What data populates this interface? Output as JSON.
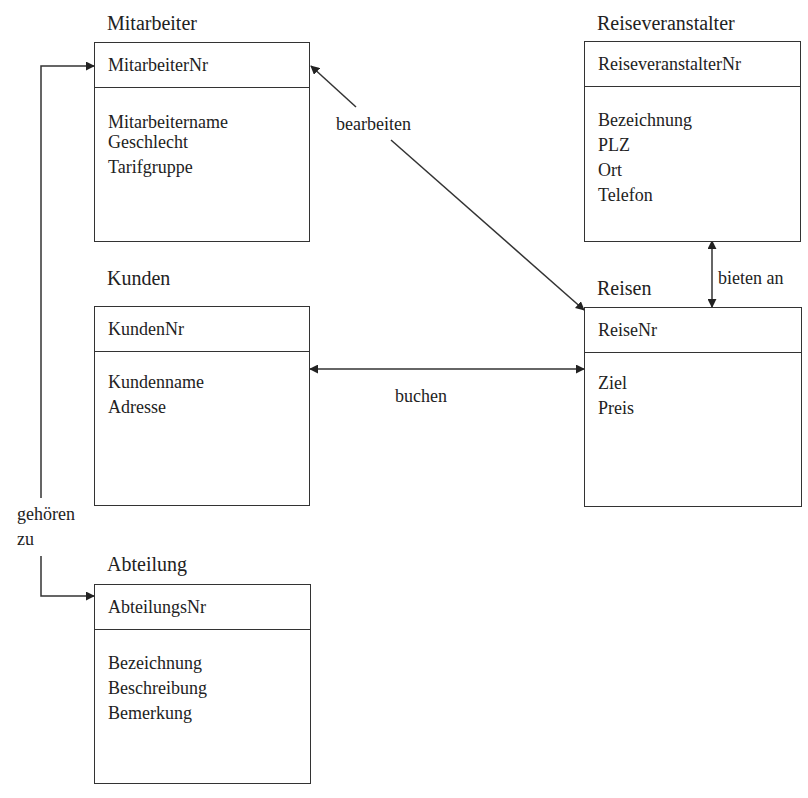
{
  "entities": {
    "mitarbeiter": {
      "title": "Mitarbeiter",
      "key": "MitarbeiterNr",
      "attributes": [
        "Mitarbeitername",
        "Geschlecht",
        "Tarifgruppe"
      ]
    },
    "reiseveranstalter": {
      "title": "Reiseveranstalter",
      "key": "ReiseveranstalterNr",
      "attributes": [
        "Bezeichnung",
        "PLZ",
        "Ort",
        "Telefon"
      ]
    },
    "kunden": {
      "title": "Kunden",
      "key": "KundenNr",
      "attributes": [
        "Kundenname",
        "Adresse"
      ]
    },
    "reisen": {
      "title": "Reisen",
      "key": "ReiseNr",
      "attributes": [
        "Ziel",
        "Preis"
      ]
    },
    "abteilung": {
      "title": "Abteilung",
      "key": "AbteilungsNr",
      "attributes": [
        "Bezeichnung",
        "Beschreibung",
        "Bemerkung"
      ]
    }
  },
  "relationships": {
    "bearbeiten": {
      "label": "bearbeiten",
      "from": "Mitarbeiter",
      "to": "Reisen"
    },
    "buchen": {
      "label": "buchen",
      "from": "Kunden",
      "to": "Reisen"
    },
    "bieten_an": {
      "label": "bieten an",
      "from": "Reiseveranstalter",
      "to": "Reisen"
    },
    "gehoeren_zu": {
      "label_line1": "gehören",
      "label_line2": "zu",
      "from": "Mitarbeiter",
      "to": "Abteilung"
    }
  },
  "colors": {
    "line": "#333333",
    "text": "#222222",
    "background": "#ffffff"
  }
}
